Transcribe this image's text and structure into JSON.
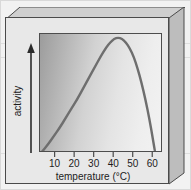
{
  "figure": {
    "kind": "scanned-textbook-graph",
    "style": "3d-slab-panel"
  },
  "colors": {
    "page_background": "#ffffff",
    "slab_face": "#e8e8e8",
    "slab_top_bevel": "#cfcfcf",
    "slab_right_bevel": "#bdbdbd",
    "frame_line": "#4a4a4a",
    "curve": "#6e6e6e",
    "axis_text": "#1c1c1c",
    "plot_gradient_dark": "#9c9c9c",
    "plot_gradient_light": "#f2f2f2"
  },
  "chart_data": {
    "type": "line",
    "title": "",
    "subtitle": "",
    "xlabel": "temperature (°C)",
    "ylabel": "activity",
    "xtick_labels": [
      "10",
      "20",
      "30",
      "40",
      "50",
      "60"
    ],
    "xticks": [
      10,
      20,
      30,
      40,
      50,
      60
    ],
    "ytick_labels": [],
    "xlim": [
      2,
      65
    ],
    "ylim": [
      0,
      100
    ],
    "grid": false,
    "legend": false,
    "legend_position": "none",
    "y_axis_style": "arrow-only-unlabelled",
    "annotations": [
      {
        "name": "y-axis-arrow",
        "text": "",
        "meaning": "increasing activity"
      }
    ],
    "series": [
      {
        "name": "enzyme activity",
        "color": "#6e6e6e",
        "x": [
          3,
          6,
          9,
          12,
          15,
          18,
          21,
          24,
          27,
          30,
          33,
          36,
          38,
          40,
          42,
          44,
          46,
          48,
          50,
          52,
          54,
          56,
          58,
          60,
          61
        ],
        "y": [
          1,
          7,
          14,
          21,
          29,
          37,
          45,
          54,
          63,
          72,
          81,
          89,
          93,
          96,
          97,
          96,
          93,
          88,
          81,
          71,
          59,
          45,
          29,
          10,
          0
        ]
      }
    ]
  }
}
